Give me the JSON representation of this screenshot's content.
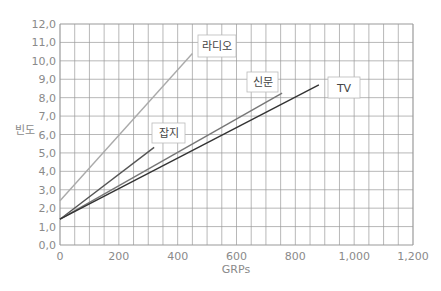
{
  "chart_data": {
    "type": "line",
    "title": "",
    "xlabel": "GRPs",
    "ylabel": "빈도",
    "xlim": [
      0,
      1200
    ],
    "ylim": [
      0,
      12
    ],
    "grid": true,
    "x_ticks": [
      0,
      200,
      400,
      600,
      800,
      1000,
      1200
    ],
    "x_tick_labels": [
      "0",
      "200",
      "400",
      "600",
      "800",
      "1,000",
      "1,200"
    ],
    "y_ticks": [
      0,
      1,
      2,
      3,
      4,
      5,
      6,
      7,
      8,
      9,
      10,
      11,
      12
    ],
    "y_tick_labels": [
      "0,0",
      "1,0",
      "2,0",
      "3,0",
      "4,0",
      "5,0",
      "6,0",
      "7,0",
      "8,0",
      "9,0",
      "10,0",
      "11,0",
      "12,0"
    ],
    "legend_position": "inline-labels",
    "series": [
      {
        "name": "라디오",
        "color": "#aaaaaa",
        "x": [
          0,
          450
        ],
        "values": [
          2.4,
          10.4
        ]
      },
      {
        "name": "잡지",
        "color": "#555555",
        "x": [
          0,
          320
        ],
        "values": [
          1.4,
          5.3
        ]
      },
      {
        "name": "신문",
        "color": "#777777",
        "x": [
          0,
          755
        ],
        "values": [
          1.4,
          8.25
        ]
      },
      {
        "name": "TV",
        "color": "#333333",
        "x": [
          0,
          880
        ],
        "values": [
          1.4,
          8.7
        ]
      }
    ],
    "labels": [
      {
        "text": "라디오",
        "box": [
          198,
          35,
          38,
          22
        ]
      },
      {
        "text": "잡지",
        "box": [
          152,
          123,
          33,
          20
        ]
      },
      {
        "text": "신문",
        "box": [
          247,
          72,
          31,
          20
        ]
      },
      {
        "text": "TV",
        "box": [
          328,
          77,
          32,
          21
        ]
      }
    ]
  }
}
